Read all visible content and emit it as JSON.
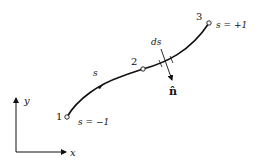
{
  "diagram": {
    "nodes": [
      {
        "id": "1",
        "label": "1",
        "param_label": "s = −1"
      },
      {
        "id": "2",
        "label": "2"
      },
      {
        "id": "3",
        "label": "3",
        "param_label": "s = +1"
      }
    ],
    "curve_param_label": "s",
    "element_label": "ds",
    "normal_label": "n̂",
    "axes": {
      "x_label": "x",
      "y_label": "y"
    },
    "colors": {
      "stroke": "#111111",
      "background": "#ffffff"
    }
  }
}
